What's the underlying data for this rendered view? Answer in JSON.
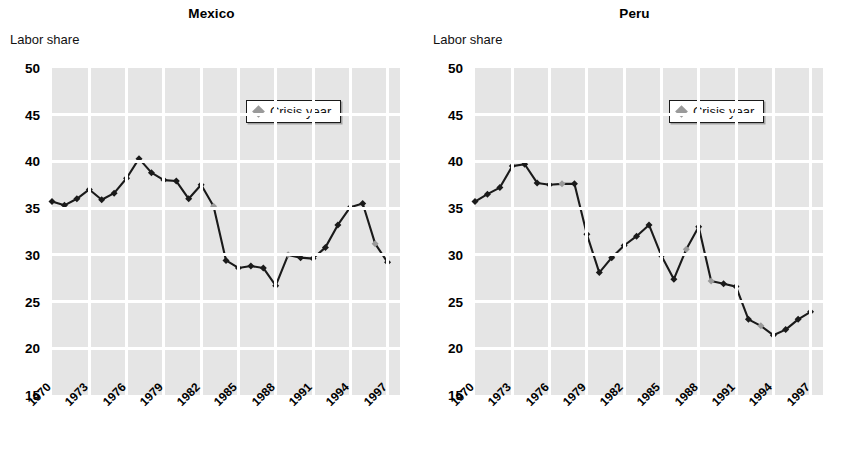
{
  "figure": {
    "y_axis_caption": "Labor share",
    "legend_label": "Crisis year",
    "legend_marker_icon": "crisis-diamond-icon",
    "colors": {
      "plot_background": "#e5e5e5",
      "gridline": "#ffffff",
      "line": "#1a1a1a",
      "marker": "#1a1a1a",
      "crisis_marker": "#9a9a9a",
      "text": "#000000"
    }
  },
  "panels": [
    {
      "id": "mexico",
      "title": "Mexico"
    },
    {
      "id": "peru",
      "title": "Peru"
    }
  ],
  "chart_data": [
    {
      "type": "line",
      "title": "Mexico",
      "xlabel": "",
      "ylabel": "Labor share",
      "ylim": [
        15,
        50
      ],
      "xlim": [
        1970,
        1998
      ],
      "yticks": [
        15,
        20,
        25,
        30,
        35,
        40,
        45,
        50
      ],
      "xticks": [
        1970,
        1973,
        1976,
        1979,
        1982,
        1985,
        1988,
        1991,
        1994,
        1997
      ],
      "grid": true,
      "legend": {
        "entries": [
          "Crisis year"
        ],
        "position": "top-right"
      },
      "x": [
        1970,
        1971,
        1972,
        1973,
        1974,
        1975,
        1976,
        1977,
        1978,
        1979,
        1980,
        1981,
        1982,
        1983,
        1984,
        1985,
        1986,
        1987,
        1988,
        1989,
        1990,
        1991,
        1992,
        1993,
        1994,
        1995,
        1996,
        1997
      ],
      "values": [
        35.7,
        35.3,
        36.0,
        37.0,
        35.9,
        36.6,
        38.2,
        40.3,
        38.8,
        38.0,
        37.9,
        36.0,
        37.5,
        35.2,
        29.4,
        28.6,
        28.8,
        28.6,
        26.7,
        30.0,
        29.7,
        29.6,
        30.8,
        33.2,
        35.1,
        35.5,
        31.2,
        29.2
      ],
      "crisis_years": [
        1983,
        1989,
        1996
      ]
    },
    {
      "type": "line",
      "title": "Peru",
      "xlabel": "",
      "ylabel": "Labor share",
      "ylim": [
        15,
        50
      ],
      "xlim": [
        1970,
        1998
      ],
      "yticks": [
        15,
        20,
        25,
        30,
        35,
        40,
        45,
        50
      ],
      "xticks": [
        1970,
        1973,
        1976,
        1979,
        1982,
        1985,
        1988,
        1991,
        1994,
        1997
      ],
      "grid": true,
      "legend": {
        "entries": [
          "Crisis year"
        ],
        "position": "top-right"
      },
      "x": [
        1970,
        1971,
        1972,
        1973,
        1974,
        1975,
        1976,
        1977,
        1978,
        1979,
        1980,
        1981,
        1982,
        1983,
        1984,
        1985,
        1986,
        1987,
        1988,
        1989,
        1990,
        1991,
        1992,
        1993,
        1994,
        1995,
        1996,
        1997
      ],
      "values": [
        35.7,
        36.5,
        37.2,
        39.5,
        39.7,
        37.7,
        37.5,
        37.6,
        37.6,
        32.2,
        28.1,
        29.7,
        31.0,
        32.0,
        33.2,
        29.9,
        27.4,
        30.6,
        33.0,
        27.2,
        26.9,
        26.6,
        23.1,
        22.4,
        21.4,
        22.0,
        23.1,
        23.9
      ],
      "crisis_years": [
        1977,
        1987,
        1989,
        1993
      ]
    }
  ]
}
